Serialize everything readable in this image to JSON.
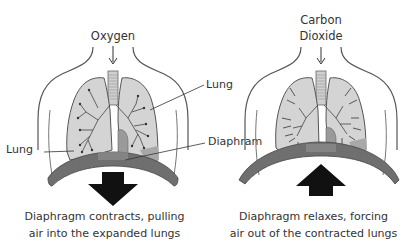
{
  "diagram": {
    "type": "breathing-mechanism",
    "colors": {
      "lung_fill": "#d4d4d4",
      "diaphragm": "#6f6f6f",
      "heart": "#9a9a9a",
      "outline": "#555555",
      "arrow": "#111111"
    },
    "panels": [
      {
        "name": "inhalation",
        "top_label_lines": [
          "Oxygen"
        ],
        "big_arrow_direction": "down",
        "caption_lines": [
          "Diaphragm contracts, pulling",
          "air into the expanded lungs"
        ]
      },
      {
        "name": "exhalation",
        "top_label_lines": [
          "Carbon",
          "Dioxide"
        ],
        "big_arrow_direction": "up",
        "caption_lines": [
          "Diaphragm relaxes, forcing",
          "air out of the contracted lungs"
        ]
      }
    ],
    "callouts": {
      "lung_right": "Lung",
      "lung_left": "Lung",
      "diaphragm": "Diaphram"
    }
  }
}
